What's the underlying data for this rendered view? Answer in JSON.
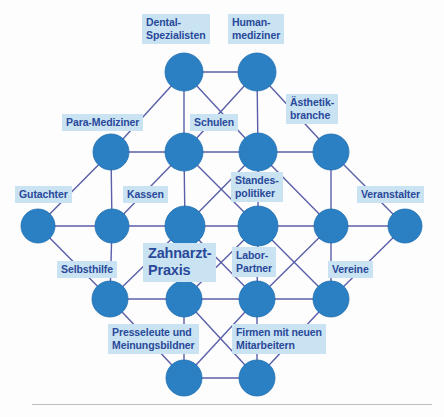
{
  "diagram": {
    "node_color": "#2b80c4",
    "node_edge_color": "#1f6fb0",
    "edge_color": "#5a5fa8",
    "label_bg": "#c9e3f2",
    "label_text_color": "#29499a",
    "background": "#fdfdfd",
    "rule_color": "#bdbdbd",
    "labels": [
      {
        "id": "dental-spezialisten",
        "text": "Dental-\nSpezialisten",
        "x": 142,
        "y": 14,
        "size": "normal"
      },
      {
        "id": "humanmediziner",
        "text": "Human-\nmediziner",
        "x": 228,
        "y": 14,
        "size": "normal"
      },
      {
        "id": "para-mediziner",
        "text": "Para-Mediziner",
        "x": 62,
        "y": 114,
        "size": "normal"
      },
      {
        "id": "schulen",
        "text": "Schulen",
        "x": 190,
        "y": 114,
        "size": "normal"
      },
      {
        "id": "aesthetikbranche",
        "text": "Ästhetik-\nbranche",
        "x": 286,
        "y": 94,
        "size": "normal"
      },
      {
        "id": "gutachter",
        "text": "Gutachter",
        "x": 15,
        "y": 186,
        "size": "normal"
      },
      {
        "id": "kassen",
        "text": "Kassen",
        "x": 123,
        "y": 186,
        "size": "normal"
      },
      {
        "id": "standespolitiker",
        "text": "Standes-\npolitiker",
        "x": 231,
        "y": 172,
        "size": "normal"
      },
      {
        "id": "veranstalter",
        "text": "Veranstalter",
        "x": 357,
        "y": 186,
        "size": "normal"
      },
      {
        "id": "zahnarzt-praxis",
        "text": "Zahnarzt-\nPraxis",
        "x": 143,
        "y": 243,
        "size": "center"
      },
      {
        "id": "labor-partner",
        "text": "Labor-\nPartner",
        "x": 232,
        "y": 247,
        "size": "normal"
      },
      {
        "id": "selbsthilfe",
        "text": "Selbsthilfe",
        "x": 57,
        "y": 261,
        "size": "normal"
      },
      {
        "id": "vereine",
        "text": "Vereine",
        "x": 328,
        "y": 261,
        "size": "normal"
      },
      {
        "id": "presseleute",
        "text": "Presseleute und\nMeinungsbildner",
        "x": 108,
        "y": 324,
        "size": "normal"
      },
      {
        "id": "firmen-mitarbeiter",
        "text": "Firmen mit neuen\nMitarbeitern",
        "x": 232,
        "y": 324,
        "size": "normal"
      }
    ],
    "nodes": [
      {
        "id": "n-r1-a",
        "row": 1,
        "cx": 184,
        "cy": 72,
        "r": 19
      },
      {
        "id": "n-r1-b",
        "row": 1,
        "cx": 257,
        "cy": 72,
        "r": 19
      },
      {
        "id": "n-r2-a",
        "row": 2,
        "cx": 111,
        "cy": 152,
        "r": 18
      },
      {
        "id": "n-r2-b",
        "row": 2,
        "cx": 184,
        "cy": 152,
        "r": 19
      },
      {
        "id": "n-r2-c",
        "row": 2,
        "cx": 258,
        "cy": 152,
        "r": 19
      },
      {
        "id": "n-r2-d",
        "row": 2,
        "cx": 331,
        "cy": 152,
        "r": 18
      },
      {
        "id": "n-r3-a",
        "row": 3,
        "cx": 38,
        "cy": 226,
        "r": 17
      },
      {
        "id": "n-r3-b",
        "row": 3,
        "cx": 112,
        "cy": 226,
        "r": 17
      },
      {
        "id": "n-r3-c",
        "row": 3,
        "cx": 185,
        "cy": 226,
        "r": 20
      },
      {
        "id": "n-r3-d",
        "row": 3,
        "cx": 258,
        "cy": 226,
        "r": 20
      },
      {
        "id": "n-r3-e",
        "row": 3,
        "cx": 331,
        "cy": 226,
        "r": 17
      },
      {
        "id": "n-r3-f",
        "row": 3,
        "cx": 405,
        "cy": 226,
        "r": 17
      },
      {
        "id": "n-r4-a",
        "row": 4,
        "cx": 110,
        "cy": 299,
        "r": 18
      },
      {
        "id": "n-r4-b",
        "row": 4,
        "cx": 184,
        "cy": 299,
        "r": 18
      },
      {
        "id": "n-r4-c",
        "row": 4,
        "cx": 257,
        "cy": 299,
        "r": 18
      },
      {
        "id": "n-r4-d",
        "row": 4,
        "cx": 331,
        "cy": 299,
        "r": 18
      },
      {
        "id": "n-r5-a",
        "row": 5,
        "cx": 184,
        "cy": 378,
        "r": 18
      },
      {
        "id": "n-r5-b",
        "row": 5,
        "cx": 257,
        "cy": 378,
        "r": 18
      }
    ],
    "edges": [
      {
        "from": "n-r1-a",
        "to": "n-r1-b"
      },
      {
        "from": "n-r1-a",
        "to": "n-r2-a"
      },
      {
        "from": "n-r1-a",
        "to": "n-r2-b"
      },
      {
        "from": "n-r1-a",
        "to": "n-r2-c"
      },
      {
        "from": "n-r1-b",
        "to": "n-r2-b"
      },
      {
        "from": "n-r1-b",
        "to": "n-r2-c"
      },
      {
        "from": "n-r1-b",
        "to": "n-r2-d"
      },
      {
        "from": "n-r2-a",
        "to": "n-r2-b"
      },
      {
        "from": "n-r2-b",
        "to": "n-r2-c"
      },
      {
        "from": "n-r2-c",
        "to": "n-r2-d"
      },
      {
        "from": "n-r2-a",
        "to": "n-r3-a"
      },
      {
        "from": "n-r2-a",
        "to": "n-r3-b"
      },
      {
        "from": "n-r2-b",
        "to": "n-r3-b"
      },
      {
        "from": "n-r2-b",
        "to": "n-r3-c"
      },
      {
        "from": "n-r2-b",
        "to": "n-r3-d"
      },
      {
        "from": "n-r2-c",
        "to": "n-r3-c"
      },
      {
        "from": "n-r2-c",
        "to": "n-r3-d"
      },
      {
        "from": "n-r2-c",
        "to": "n-r3-e"
      },
      {
        "from": "n-r2-d",
        "to": "n-r3-e"
      },
      {
        "from": "n-r2-d",
        "to": "n-r3-f"
      },
      {
        "from": "n-r3-a",
        "to": "n-r3-b"
      },
      {
        "from": "n-r3-b",
        "to": "n-r3-c"
      },
      {
        "from": "n-r3-c",
        "to": "n-r3-d"
      },
      {
        "from": "n-r3-d",
        "to": "n-r3-e"
      },
      {
        "from": "n-r3-e",
        "to": "n-r3-f"
      },
      {
        "from": "n-r3-a",
        "to": "n-r4-a"
      },
      {
        "from": "n-r3-b",
        "to": "n-r4-a"
      },
      {
        "from": "n-r3-c",
        "to": "n-r4-a"
      },
      {
        "from": "n-r3-c",
        "to": "n-r4-b"
      },
      {
        "from": "n-r3-c",
        "to": "n-r4-c"
      },
      {
        "from": "n-r3-d",
        "to": "n-r4-b"
      },
      {
        "from": "n-r3-d",
        "to": "n-r4-c"
      },
      {
        "from": "n-r3-d",
        "to": "n-r4-d"
      },
      {
        "from": "n-r3-e",
        "to": "n-r4-c"
      },
      {
        "from": "n-r3-e",
        "to": "n-r4-d"
      },
      {
        "from": "n-r3-f",
        "to": "n-r4-d"
      },
      {
        "from": "n-r4-a",
        "to": "n-r4-b"
      },
      {
        "from": "n-r4-b",
        "to": "n-r4-c"
      },
      {
        "from": "n-r4-c",
        "to": "n-r4-d"
      },
      {
        "from": "n-r4-a",
        "to": "n-r5-a"
      },
      {
        "from": "n-r4-b",
        "to": "n-r5-a"
      },
      {
        "from": "n-r4-b",
        "to": "n-r5-b"
      },
      {
        "from": "n-r4-c",
        "to": "n-r5-a"
      },
      {
        "from": "n-r4-c",
        "to": "n-r5-b"
      },
      {
        "from": "n-r4-d",
        "to": "n-r5-b"
      },
      {
        "from": "n-r5-a",
        "to": "n-r5-b"
      }
    ]
  }
}
